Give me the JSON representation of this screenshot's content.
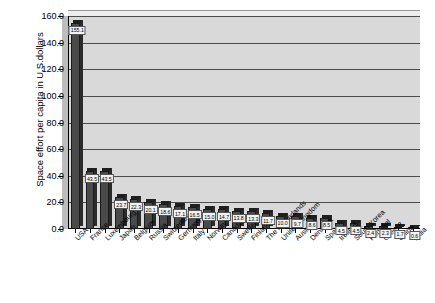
{
  "chart_data": {
    "type": "bar",
    "title": "",
    "xlabel": "",
    "ylabel": "Space effort per capita in U.S.dollars",
    "ylim": [
      0,
      160
    ],
    "ytick_step": 20,
    "grid": true,
    "legend": "none",
    "yticks": [
      "0.0",
      "20.0",
      "40.0",
      "60.0",
      "80.0",
      "100.0",
      "120.0",
      "140.0",
      "160.0"
    ],
    "categories": [
      "USA",
      "France",
      "Luxembourg",
      "Japan",
      "Belgium",
      "Russia",
      "Switzerland",
      "Germany",
      "Italy",
      "Norway",
      "Canada",
      "Sweden",
      "Finland",
      "The Netherlands",
      "United Kingdom",
      "Austria",
      "Denmark",
      "Spain",
      "Ireland",
      "South Korea",
      "Portugal",
      "Greece",
      "China",
      "India"
    ],
    "values": [
      155.1,
      43.5,
      43.5,
      23.7,
      22.3,
      20.1,
      18.6,
      17.1,
      16.5,
      15.0,
      14.7,
      13.8,
      13.3,
      11.7,
      10.0,
      9.7,
      8.6,
      8.5,
      4.5,
      4.5,
      2.4,
      2.3,
      1.7,
      0.6
    ],
    "value_labels": [
      "155.1",
      "43.5",
      "43.5",
      "23.7",
      "22.3",
      "20.1",
      "18.6",
      "17.1",
      "16.5",
      "15.0",
      "14.7",
      "13.8",
      "13.3",
      "11.7",
      "10.0",
      "9.7",
      "8.6",
      "8.5",
      "4.5",
      "4.5",
      "2.4",
      "2.3",
      "1.7",
      "0.6"
    ],
    "colors": {
      "bar_front": "#4a4a4a",
      "bar_top": "#1f1f1f",
      "plot_background": "#d9d9d9",
      "gridline": "#4d4d4d",
      "page_background": "#ffffff",
      "label_background": "#f2f2f2"
    }
  }
}
